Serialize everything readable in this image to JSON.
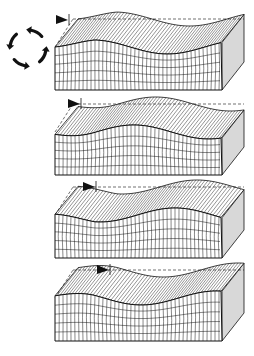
{
  "figure": {
    "stage_count": 4,
    "colors": {
      "background": "#ffffff",
      "ink": "#111111",
      "side_shade": "#d8d8d8",
      "flag": "#111111"
    },
    "rotation_arrows": {
      "icon": "circular-motion-arrows",
      "count": 4,
      "direction": "counter-clockwise"
    },
    "stages": [
      {
        "index": 1,
        "marker": "flag",
        "marker_x": 68,
        "marker_y": 20
      },
      {
        "index": 2,
        "marker": "flag",
        "marker_x": 80,
        "marker_y": 104
      },
      {
        "index": 3,
        "marker": "flag",
        "marker_x": 95,
        "marker_y": 187
      },
      {
        "index": 4,
        "marker": "flag",
        "marker_x": 109,
        "marker_y": 270
      }
    ]
  }
}
